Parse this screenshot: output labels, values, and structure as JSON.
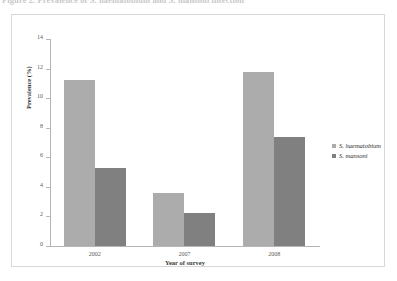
{
  "caption": {
    "text": "Figure 2. Prevalence of S. haematobium and S. mansoni infection"
  },
  "legend": {
    "position": "right",
    "items": [
      {
        "label": "S. haematobium",
        "color": "#ACACAC"
      },
      {
        "label": "S. mansoni",
        "color": "#808080"
      }
    ]
  },
  "chart_data": {
    "type": "bar",
    "title": "",
    "xlabel": "Year of survey",
    "ylabel": "Prevalence (%)",
    "categories": [
      "2002",
      "2007",
      "2008"
    ],
    "series": [
      {
        "name": "S. haematobium",
        "color": "#ACACAC",
        "values": [
          11.2,
          3.6,
          11.8
        ]
      },
      {
        "name": "S. mansoni",
        "color": "#808080",
        "values": [
          5.3,
          2.2,
          7.4
        ]
      }
    ],
    "ylim": [
      0,
      14
    ],
    "yticks": [
      0,
      2,
      4,
      6,
      8,
      10,
      12,
      14
    ],
    "ytick_labels": [
      "0",
      "2",
      "4",
      "6",
      "8",
      "10",
      "12",
      "14"
    ],
    "grid": false,
    "legend_position": "right"
  }
}
